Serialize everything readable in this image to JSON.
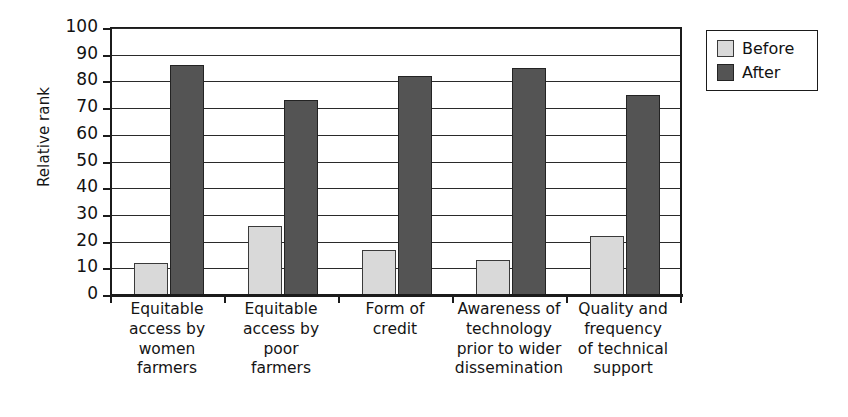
{
  "chart_data": {
    "type": "bar",
    "title": "",
    "xlabel": "",
    "ylabel": "Relative rank",
    "ylim": [
      0,
      100
    ],
    "y_ticks": [
      0,
      10,
      20,
      30,
      40,
      50,
      60,
      70,
      80,
      90,
      100
    ],
    "grid": true,
    "legend_position": "top-right",
    "categories": [
      "Equitable access by women farmers",
      "Equitable access by poor farmers",
      "Form of credit",
      "Awareness of technology prior to wider dissemination",
      "Quality and frequency of technical support"
    ],
    "category_lines": [
      [
        "Equitable",
        "access by",
        "women",
        "farmers"
      ],
      [
        "Equitable",
        "access by",
        "poor",
        "farmers"
      ],
      [
        "Form of",
        "credit"
      ],
      [
        "Awareness of",
        "technology",
        "prior to wider",
        "dissemination"
      ],
      [
        "Quality and",
        "frequency",
        "of technical",
        "support"
      ]
    ],
    "series": [
      {
        "name": "Before",
        "color": "#d9d9d9",
        "values": [
          12,
          26,
          17,
          13,
          22
        ]
      },
      {
        "name": "After",
        "color": "#545454",
        "values": [
          86,
          73,
          82,
          85,
          75
        ]
      }
    ]
  },
  "axis": {
    "y_title": "Relative rank",
    "y_tick_labels": [
      "100",
      "90",
      "80",
      "70",
      "60",
      "50",
      "40",
      "30",
      "20",
      "10",
      "0"
    ]
  },
  "legend": {
    "items": [
      {
        "label": "Before"
      },
      {
        "label": "After"
      }
    ]
  }
}
